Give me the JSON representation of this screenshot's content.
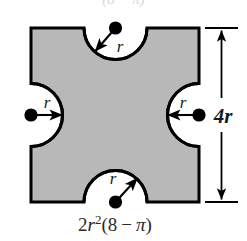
{
  "figure": {
    "type": "geometry-diagram",
    "clipped_top_text": "(8 − π)",
    "caption": "2r²(8 − π)",
    "caption_parts": {
      "coefficient": "2",
      "variable": "r",
      "exponent": "2",
      "open_paren": "(",
      "eight": "8",
      "minus": "−",
      "pi": "π",
      "close_paren": ")"
    },
    "colors": {
      "shaded_fill": "#b8b8b8",
      "cutout_fill": "#ffffff",
      "outline": "#000000",
      "page_background": "#ffffff",
      "label_text": "#1a1a1a"
    },
    "square": {
      "side_label": "4r",
      "fill": "#b8b8b8",
      "stroke": "#000000"
    },
    "dimension": {
      "label": "4r",
      "orientation": "vertical",
      "position": "right",
      "arrowheads": "both-ends"
    },
    "semicircles": [
      {
        "id": "top",
        "position": "top-edge-midpoint",
        "radius_label": "r",
        "arrow_direction": "down-left",
        "center_dot": true
      },
      {
        "id": "right",
        "position": "right-edge-midpoint",
        "radius_label": "r",
        "arrow_direction": "left",
        "center_dot": true
      },
      {
        "id": "bottom",
        "position": "bottom-edge-midpoint",
        "radius_label": "r",
        "arrow_direction": "up-right",
        "center_dot": true
      },
      {
        "id": "left",
        "position": "left-edge-midpoint",
        "radius_label": "r",
        "arrow_direction": "right",
        "center_dot": true
      }
    ]
  }
}
